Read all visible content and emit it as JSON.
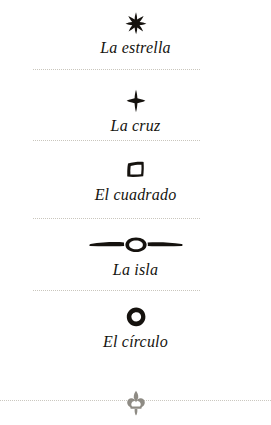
{
  "page": {
    "background_color": "#ffffff",
    "ink_color": "#15120e",
    "rule_color": "#c9c6bd",
    "ornament_color": "#8e8b84"
  },
  "entries": [
    {
      "glyph_name": "star-symbol",
      "glyph": "six-pointed-star",
      "caption": "La estrella"
    },
    {
      "glyph_name": "cross-symbol",
      "glyph": "four-pointed-cross",
      "caption": "La cruz"
    },
    {
      "glyph_name": "square-symbol",
      "glyph": "hand-drawn-square",
      "caption": "El cuadrado"
    },
    {
      "glyph_name": "island-symbol",
      "glyph": "line-with-ring",
      "caption": "La isla"
    },
    {
      "glyph_name": "circle-symbol",
      "glyph": "hand-drawn-ring",
      "caption": "El círculo"
    }
  ],
  "footer": {
    "ornament_name": "fleur-de-lis-ornament",
    "ornament": "fleur-de-lis"
  }
}
